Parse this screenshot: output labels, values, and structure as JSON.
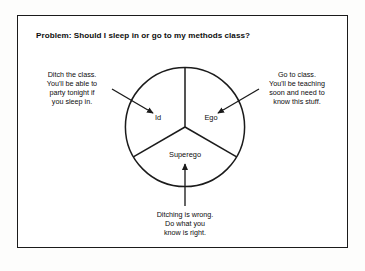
{
  "slide": {
    "title": "Problem: Should I sleep in or go to my methods class?",
    "border_color": "#1b1b1b",
    "background_color": "#ffffff"
  },
  "diagram": {
    "type": "pie-three-sector",
    "stroke_color": "#1b1b1b",
    "center": {
      "x": 185,
      "y": 127
    },
    "radius": 60,
    "sectors": [
      {
        "name": "id",
        "label": "Id",
        "start_angle_deg": 90,
        "end_angle_deg": 210
      },
      {
        "name": "ego",
        "label": "Ego",
        "start_angle_deg": 330,
        "end_angle_deg": 90
      },
      {
        "name": "superego",
        "label": "Superego",
        "start_angle_deg": 210,
        "end_angle_deg": 330
      }
    ]
  },
  "callouts": [
    {
      "name": "id",
      "text": "Ditch the class.\nYou'll be able to\nparty  tonight if\nyou sleep in.",
      "arrow": {
        "from_x": 112,
        "from_y": 89,
        "to_x": 153,
        "to_y": 113
      }
    },
    {
      "name": "ego",
      "text": "Go to class.\nYou'll be teaching\nsoon and need to\nknow this stuff.",
      "arrow": {
        "from_x": 259,
        "from_y": 89,
        "to_x": 218,
        "to_y": 113
      }
    },
    {
      "name": "superego",
      "text": "Ditching is wrong.\nDo what you\nknow is right.",
      "arrow": {
        "from_x": 185,
        "from_y": 206,
        "to_x": 185,
        "to_y": 164
      }
    }
  ]
}
